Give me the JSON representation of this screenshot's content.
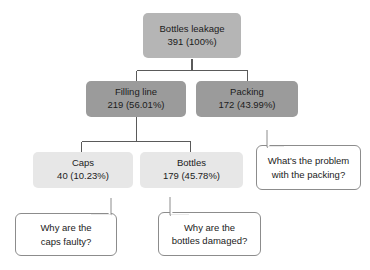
{
  "diagram": {
    "type": "tree-breakdown",
    "nodes": {
      "root": {
        "label": "Bottles leakage",
        "value": "391 (100%)",
        "count": 391,
        "percent": "100%",
        "level": 1,
        "color": "#b5b5b5"
      },
      "filling": {
        "label": "Filling line",
        "value": "219 (56.01%)",
        "count": 219,
        "percent": "56.01%",
        "level": 2,
        "color": "#9b9b9b"
      },
      "packing": {
        "label": "Packing",
        "value": "172 (43.99%)",
        "count": 172,
        "percent": "43.99%",
        "level": 2,
        "color": "#9b9b9b"
      },
      "caps": {
        "label": "Caps",
        "value": "40 (10.23%)",
        "count": 40,
        "percent": "10.23%",
        "level": 3,
        "color": "#e7e7e7"
      },
      "bottles": {
        "label": "Bottles",
        "value": "179 (45.78%)",
        "count": 179,
        "percent": "45.78%",
        "level": 3,
        "color": "#e7e7e7"
      }
    },
    "callouts": {
      "packing": {
        "line1": "What's the problem",
        "line2": "with the packing?",
        "points_to": "packing"
      },
      "caps": {
        "line1": "Why are the",
        "line2": "caps faulty?",
        "points_to": "caps"
      },
      "bottles": {
        "line1": "Why are the",
        "line2": "bottles damaged?",
        "points_to": "bottles"
      }
    },
    "edges": [
      {
        "from": "root",
        "to": "filling"
      },
      {
        "from": "root",
        "to": "packing"
      },
      {
        "from": "filling",
        "to": "caps"
      },
      {
        "from": "filling",
        "to": "bottles"
      }
    ],
    "line_color": "#5a5a5a",
    "background": "#ffffff"
  }
}
